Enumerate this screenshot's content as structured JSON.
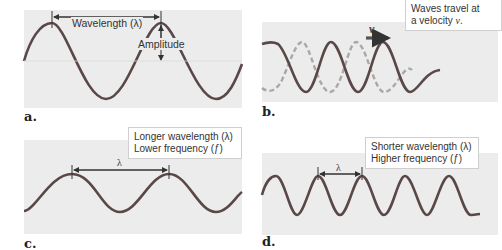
{
  "figure": {
    "panels": [
      {
        "id": "a",
        "label": "a.",
        "wavelength_label": "Wavelength (λ)",
        "amplitude_label": "Amplitude"
      },
      {
        "id": "b",
        "label": "b.",
        "callout_line1": "Waves travel at",
        "callout_line2_prefix": "a velocity ",
        "callout_line2_var": "v",
        "callout_line2_suffix": ".",
        "velocity_symbol": "v"
      },
      {
        "id": "c",
        "label": "c.",
        "callout_line1": "Longer wavelength (λ)",
        "callout_line2": "Lower frequency (ƒ)",
        "lambda_symbol": "λ"
      },
      {
        "id": "d",
        "label": "d.",
        "callout_line1": "Shorter wavelength (λ)",
        "callout_line2": "Higher frequency (ƒ)",
        "lambda_symbol": "λ"
      }
    ],
    "colors": {
      "wave": "#5a4848",
      "dashed_wave": "#a8a8a8",
      "panel_bg": "#ececec",
      "arrow": "#333333"
    }
  }
}
